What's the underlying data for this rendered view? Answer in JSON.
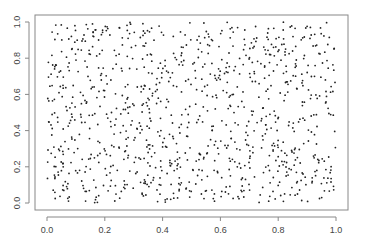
{
  "chart_data": {
    "type": "scatter",
    "title": "",
    "xlabel": "",
    "ylabel": "",
    "xlim": [
      0,
      1
    ],
    "ylim": [
      0,
      1
    ],
    "grid": false,
    "legend": null,
    "x_ticks": [
      "0.0",
      "0.2",
      "0.4",
      "0.6",
      "0.8",
      "1.0"
    ],
    "y_ticks": [
      "0.0",
      "0.2",
      "0.4",
      "0.6",
      "0.8",
      "1.0"
    ],
    "point_count_estimate": 1000,
    "distribution": "uniform random on [0,1] x [0,1]",
    "seed": 42,
    "marker_color": "#222222",
    "frame_color": "#888888"
  }
}
